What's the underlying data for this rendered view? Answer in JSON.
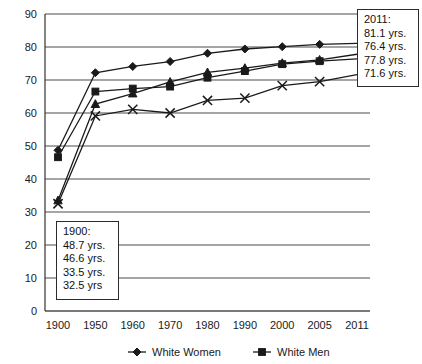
{
  "chart_data": {
    "type": "line",
    "title": "",
    "xlabel": "",
    "ylabel": "",
    "ylim": [
      0,
      90
    ],
    "ytick_step": 10,
    "grid": true,
    "legend_position": "bottom",
    "categories": [
      "1900",
      "1950",
      "1960",
      "1970",
      "1980",
      "1990",
      "2000",
      "2005",
      "2011"
    ],
    "yticks": [
      "0",
      "10",
      "20",
      "30",
      "40",
      "50",
      "60",
      "70",
      "80",
      "90"
    ],
    "series": [
      {
        "name": "White Women",
        "marker": "diamond",
        "values": [
          48.7,
          72.2,
          74.1,
          75.6,
          78.1,
          79.4,
          80.1,
          80.8,
          81.1
        ]
      },
      {
        "name": "White Men",
        "marker": "square",
        "values": [
          46.6,
          66.5,
          67.4,
          68.0,
          70.7,
          72.7,
          74.8,
          75.7,
          76.4
        ]
      },
      {
        "name": "Black Women",
        "marker": "triangle",
        "values": [
          33.5,
          62.7,
          65.9,
          69.4,
          72.3,
          73.6,
          75.1,
          76.1,
          77.8
        ]
      },
      {
        "name": "Black Men",
        "marker": "cross",
        "values": [
          32.5,
          59.1,
          61.1,
          60.0,
          63.8,
          64.5,
          68.3,
          69.5,
          71.6
        ]
      }
    ]
  },
  "annotations": {
    "box_2011": {
      "heading": "2011:",
      "lines": [
        "81.1 yrs.",
        "76.4 yrs.",
        "77.8 yrs.",
        "71.6 yrs."
      ]
    },
    "box_1900": {
      "heading": "1900:",
      "lines": [
        "48.7 yrs.",
        "46.6 yrs.",
        "33.5 yrs.",
        "32.5 yrs"
      ]
    }
  },
  "legend": {
    "entries": [
      {
        "label": "White Women",
        "marker": "diamond"
      },
      {
        "label": "White Men",
        "marker": "square"
      }
    ]
  },
  "colors": {
    "line": "#1a1a1a",
    "grid": "#4d4d4d",
    "axis": "#333333",
    "text": "#111111",
    "background": "#ffffff"
  }
}
